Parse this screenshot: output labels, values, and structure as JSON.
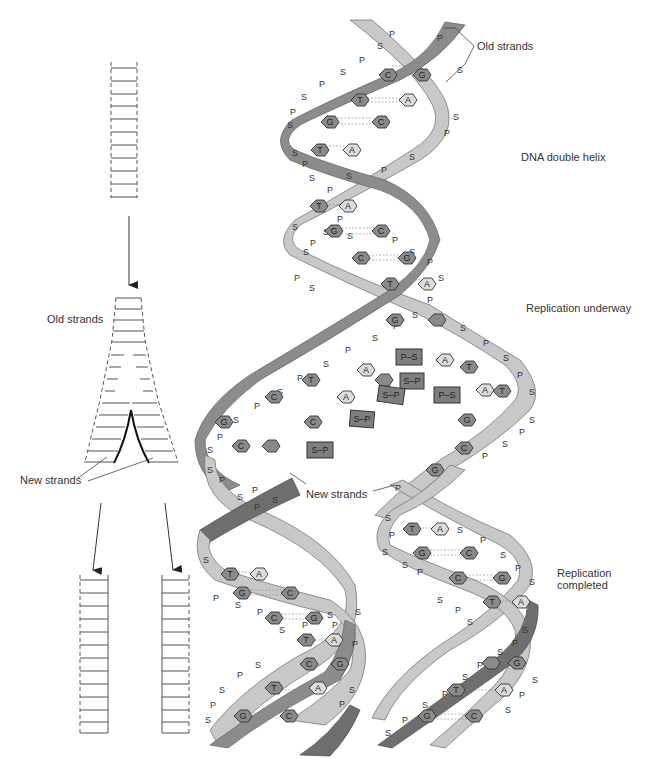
{
  "figure": {
    "labels": {
      "old_strands_top": "Old strands",
      "dna_double_helix": "DNA double helix",
      "replication_underway": "Replication underway",
      "old_strands_left": "Old strands",
      "new_strands_left": "New strands",
      "new_strands_center": "New strands",
      "replication_completed_line1": "Replication",
      "replication_completed_line2": "completed"
    },
    "backbone_units": {
      "sugar": "S",
      "phosphate": "P"
    },
    "bases": [
      "A",
      "T",
      "G",
      "C"
    ],
    "base_pairs_top_helix": [
      [
        "C",
        "G"
      ],
      [
        "T",
        "A"
      ],
      [
        "G",
        "C"
      ],
      [
        "T",
        "A"
      ],
      [
        "T",
        "A"
      ],
      [
        "G",
        "C"
      ],
      [
        "C",
        "G"
      ],
      [
        "T",
        "A"
      ],
      [
        "C",
        "G"
      ]
    ],
    "free_nucleotides": [
      "P–S",
      "S–P",
      "S–P",
      "P–S",
      "S–P",
      "S–P"
    ],
    "daughter_helix_left_pairs": [
      [
        "C",
        "G"
      ],
      [
        "T",
        "A"
      ],
      [
        "G",
        "C"
      ],
      [
        "C",
        "G"
      ],
      [
        "T",
        "A"
      ],
      [
        "C",
        "G"
      ],
      [
        "T",
        "A"
      ],
      [
        "G",
        "C"
      ]
    ],
    "daughter_helix_right_pairs": [
      [
        "T",
        "A"
      ],
      [
        "G",
        "C"
      ],
      [
        "C",
        "G"
      ],
      [
        "T",
        "A"
      ],
      [
        "C",
        "G"
      ],
      [
        "T",
        "A"
      ],
      [
        "G",
        "C"
      ]
    ],
    "colors": {
      "old_strand_dark": "#8c8c8c",
      "old_strand_light": "#c8c8c8",
      "new_strand": "#6e6e6e",
      "base_dark": "#8a8a8a",
      "base_light": "#dcdcdc",
      "line": "#333333"
    }
  }
}
